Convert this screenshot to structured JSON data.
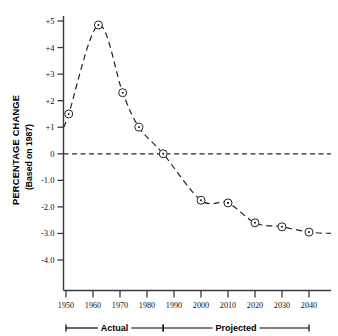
{
  "chart_data": {
    "type": "line",
    "title": "",
    "xlabel": "",
    "ylabel": "PERCENTAGE CHANGE",
    "ylabel_sub": "(Based on 1987)",
    "grid": false,
    "legend": "none",
    "xlim": [
      1947,
      2044
    ],
    "ylim": [
      -4.6,
      5.4
    ],
    "x_ticks": [
      "1950",
      "1960",
      "1970",
      "1980",
      "1990",
      "2000",
      "2010",
      "2020",
      "2030",
      "2040"
    ],
    "x_tick_values": [
      1950,
      1960,
      1970,
      1980,
      1990,
      2000,
      2010,
      2020,
      2030,
      2040
    ],
    "y_ticks": [
      "+5",
      "+4",
      "+3",
      "+2",
      "+1",
      "0",
      "-1.0",
      "-2.0",
      "-3.0",
      "-4.0"
    ],
    "y_tick_values": [
      5,
      4,
      3,
      2,
      1,
      0,
      -1,
      -2,
      -3,
      -4
    ],
    "zero_reference_line": 0,
    "series": [
      {
        "name": "Percentage change based on 1987",
        "x": [
          1951,
          1962,
          1971,
          1977,
          1986,
          2000,
          2010,
          2020,
          2030,
          2040
        ],
        "values": [
          1.5,
          4.85,
          2.3,
          1.0,
          0.0,
          -1.75,
          -1.85,
          -2.6,
          -2.75,
          -2.95
        ]
      }
    ],
    "annotations": [
      {
        "label": "Actual",
        "from": 1950,
        "to": 1986
      },
      {
        "label": "Projected",
        "from": 1986,
        "to": 2040
      }
    ]
  }
}
